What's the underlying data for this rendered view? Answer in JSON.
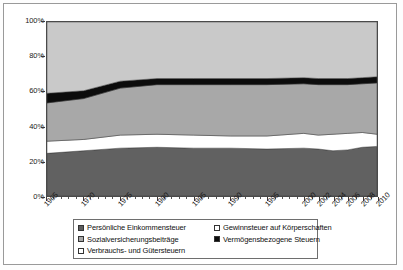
{
  "chart_data": {
    "type": "area",
    "title": "",
    "subtitle": "",
    "xlabel": "",
    "ylabel": "",
    "stacked": true,
    "stack_mode": "percent",
    "grid": false,
    "legend_position": "bottom",
    "ylim": [
      0,
      100
    ],
    "xlim": [
      1965,
      2010
    ],
    "y_ticks": [
      "0%",
      "20%",
      "40%",
      "60%",
      "80%",
      "100%"
    ],
    "y_tick_values": [
      0,
      20,
      40,
      60,
      80,
      100
    ],
    "categories": [
      1965,
      1970,
      1975,
      1980,
      1985,
      1990,
      1995,
      2000,
      2002,
      2004,
      2006,
      2008,
      2010
    ],
    "x_tick_labels": [
      "1965",
      "1970",
      "1975",
      "1980",
      "1985",
      "1990",
      "1995",
      "2000",
      "2002",
      "2004",
      "2006",
      "2008",
      "2010"
    ],
    "series": [
      {
        "name": "Persönliche Einkommensteuer",
        "color": "#616161",
        "values": [
          24.5,
          26.0,
          27.5,
          28.0,
          27.5,
          27.5,
          27.0,
          27.5,
          27.0,
          26.0,
          26.5,
          28.0,
          28.5
        ]
      },
      {
        "name": "Gewinnsteuer auf Körperschaften",
        "color": "#ffffff",
        "values": [
          7.0,
          6.5,
          7.5,
          7.5,
          7.5,
          7.0,
          7.5,
          8.5,
          8.0,
          9.5,
          9.5,
          8.5,
          7.0
        ]
      },
      {
        "name": "Sozialversicherungsbeiträge",
        "color": "#a8a8a8",
        "values": [
          22.0,
          23.5,
          27.0,
          28.5,
          29.0,
          29.5,
          29.5,
          28.5,
          29.0,
          28.5,
          28.0,
          28.0,
          29.5
        ]
      },
      {
        "name": "Vermögensbezogene Steuern",
        "color": "#0c0c0c",
        "values": [
          5.5,
          4.5,
          4.0,
          3.5,
          3.5,
          3.5,
          3.5,
          3.5,
          3.5,
          3.5,
          3.5,
          3.5,
          3.5
        ]
      },
      {
        "name": "Verbrauchs- und Gütersteuern",
        "color": "#c9c9c9",
        "values": [
          41.0,
          39.5,
          34.0,
          32.5,
          32.5,
          32.5,
          32.5,
          32.0,
          32.5,
          32.5,
          32.5,
          32.0,
          31.5
        ]
      }
    ]
  },
  "legend": {
    "items": [
      {
        "label": "Persönliche Einkommensteuer",
        "color": "#5c5c5c"
      },
      {
        "label": "Sozialversicherungsbeiträge",
        "color": "#a8a8a8"
      },
      {
        "label": "Verbrauchs- und Gütersteuern",
        "color": "#ffffff"
      },
      {
        "label": "Gewinnsteuer auf Körperschaften",
        "color": "#ffffff"
      },
      {
        "label": "Vermögensbezogene Steuern",
        "color": "#0c0c0c"
      }
    ]
  }
}
